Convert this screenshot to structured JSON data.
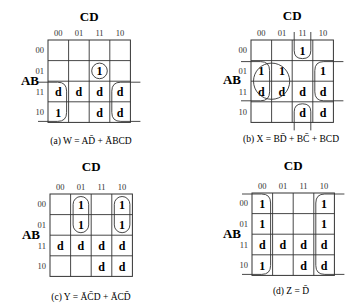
{
  "column_variable": "CD",
  "row_variable": "AB",
  "column_headers": [
    "00",
    "01",
    "11",
    "10"
  ],
  "row_headers": [
    "00",
    "01",
    "11",
    "10"
  ],
  "maps": [
    {
      "id": "a",
      "caption_prefix": "(a) ",
      "caption": "W = AD̄ + ĀBCD",
      "function": "W",
      "cells": [
        [
          "",
          "",
          "",
          ""
        ],
        [
          "",
          "",
          "1",
          ""
        ],
        [
          "d",
          "d",
          "d",
          "d"
        ],
        [
          "1",
          "",
          "d",
          "d"
        ]
      ],
      "groups": [
        {
          "term": "AD̄",
          "cells": [
            [
              2,
              0
            ],
            [
              3,
              0
            ],
            [
              2,
              3
            ],
            [
              3,
              3
            ]
          ],
          "wraps": "horizontal"
        },
        {
          "term": "ĀBCD",
          "cells": [
            [
              1,
              2
            ]
          ]
        }
      ]
    },
    {
      "id": "b",
      "caption_prefix": "(b) ",
      "caption": "X = BD̄ + BC̄ + BCD",
      "function": "X",
      "cells": [
        [
          "",
          "",
          "1",
          ""
        ],
        [
          "1",
          "1",
          "",
          "1"
        ],
        [
          "d",
          "d",
          "d",
          "d"
        ],
        [
          "",
          "",
          "d",
          "d"
        ]
      ],
      "groups": [
        {
          "term": "BD̄",
          "cells": [
            [
              1,
              0
            ],
            [
              2,
              0
            ],
            [
              1,
              3
            ],
            [
              2,
              3
            ]
          ],
          "wraps": "horizontal"
        },
        {
          "term": "BC̄",
          "cells": [
            [
              1,
              0
            ],
            [
              1,
              1
            ],
            [
              2,
              0
            ],
            [
              2,
              1
            ]
          ]
        },
        {
          "term": "BCD",
          "cells": [
            [
              0,
              2
            ],
            [
              3,
              2
            ]
          ],
          "wraps": "vertical"
        }
      ]
    },
    {
      "id": "c",
      "caption_prefix": "(c) ",
      "caption": "Y = ĀC̄D + ĀCD̄",
      "function": "Y",
      "cells": [
        [
          "",
          "1",
          "",
          "1"
        ],
        [
          "",
          "1",
          "",
          "1"
        ],
        [
          "d",
          "d",
          "d",
          "d"
        ],
        [
          "",
          "",
          "d",
          "d"
        ]
      ],
      "groups": [
        {
          "term": "ĀC̄D",
          "cells": [
            [
              0,
              1
            ],
            [
              1,
              1
            ]
          ]
        },
        {
          "term": "ĀCD̄",
          "cells": [
            [
              0,
              3
            ],
            [
              1,
              3
            ]
          ]
        }
      ]
    },
    {
      "id": "d",
      "caption_prefix": "(d) ",
      "caption": "Z = D̄",
      "function": "Z",
      "cells": [
        [
          "1",
          "",
          "",
          "1"
        ],
        [
          "1",
          "",
          "",
          "1"
        ],
        [
          "d",
          "d",
          "d",
          "d"
        ],
        [
          "1",
          "",
          "d",
          "d"
        ]
      ],
      "groups": [
        {
          "term": "D̄",
          "cells": [
            [
              0,
              0
            ],
            [
              1,
              0
            ],
            [
              2,
              0
            ],
            [
              3,
              0
            ],
            [
              0,
              3
            ],
            [
              1,
              3
            ],
            [
              2,
              3
            ],
            [
              3,
              3
            ]
          ],
          "wraps": "horizontal"
        }
      ]
    }
  ]
}
